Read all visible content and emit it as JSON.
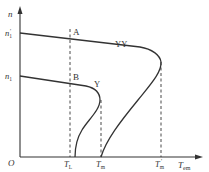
{
  "diagram": {
    "axes": {
      "y_label": "n",
      "x_label": "T",
      "x_label_sub": "em",
      "origin_label": "O"
    },
    "y_ticks": [
      {
        "label": "n",
        "sub": "1",
        "sup": "'",
        "y": 33
      },
      {
        "label": "n",
        "sub": "1",
        "sup": "",
        "y": 76
      }
    ],
    "x_ticks": [
      {
        "label": "T",
        "sub": "L",
        "sup": "",
        "x": 70
      },
      {
        "label": "T",
        "sub": "m",
        "sup": "",
        "x": 101
      },
      {
        "label": "T",
        "sub": "m",
        "sup": "'",
        "x": 161
      }
    ],
    "curves": [
      {
        "name": "YY",
        "label": "YY"
      },
      {
        "name": "Y",
        "label": "Y"
      }
    ],
    "points": [
      {
        "name": "A",
        "label": "A"
      },
      {
        "name": "B",
        "label": "B"
      }
    ],
    "colors": {
      "line": "#333333",
      "background": "#ffffff"
    }
  }
}
